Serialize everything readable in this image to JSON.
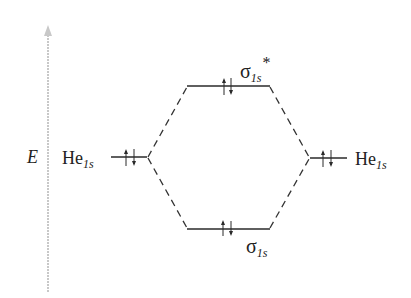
{
  "diagram": {
    "axis": {
      "label": "E",
      "direction": "up",
      "color": "#c8c8c8"
    },
    "atomic_orbitals": [
      {
        "id": "left",
        "label_main": "He",
        "label_sub": "1s",
        "electrons": "↑↓",
        "electron_count": 2
      },
      {
        "id": "right",
        "label_main": "He",
        "label_sub": "1s",
        "electrons": "↑↓",
        "electron_count": 2
      }
    ],
    "molecular_orbitals": [
      {
        "id": "antibonding",
        "label_main": "σ",
        "label_sub": "1s",
        "label_sup": "*",
        "electrons": "↑↓",
        "electron_count": 2,
        "energy_rank": "high"
      },
      {
        "id": "bonding",
        "label_main": "σ",
        "label_sub": "1s",
        "label_sup": "",
        "electrons": "↑↓",
        "electron_count": 2,
        "energy_rank": "low"
      }
    ],
    "connectors": [
      {
        "from": "left",
        "to": "antibonding",
        "style": "dashed"
      },
      {
        "from": "left",
        "to": "bonding",
        "style": "dashed"
      },
      {
        "from": "right",
        "to": "antibonding",
        "style": "dashed"
      },
      {
        "from": "right",
        "to": "bonding",
        "style": "dashed"
      }
    ]
  }
}
